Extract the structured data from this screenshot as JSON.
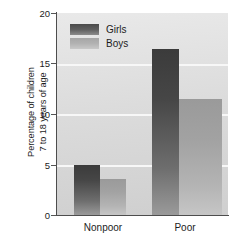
{
  "chart_data": {
    "type": "bar",
    "title": "",
    "xlabel": "",
    "ylabel_line1": "Percentage of children",
    "ylabel_line2": "7 to 18 years of age",
    "categories": [
      "Nonpoor",
      "Poor"
    ],
    "series": [
      {
        "name": "Girls",
        "values": [
          5.0,
          16.4
        ],
        "color": "#4a4a4a"
      },
      {
        "name": "Boys",
        "values": [
          3.6,
          11.5
        ],
        "color": "#a8a8a8"
      }
    ],
    "ylim": [
      0,
      20
    ],
    "yticks": [
      "0",
      "5",
      "10",
      "15",
      "20"
    ],
    "ytick_values": [
      0,
      5,
      10,
      15,
      20
    ],
    "grid": true,
    "legend_position": "top-left-inside",
    "plot_background": "#dedede",
    "gridline_color": "#f7f7f7",
    "axis_color": "#4d4d4d"
  },
  "legend": {
    "entries": [
      {
        "label": "Girls"
      },
      {
        "label": "Boys"
      }
    ]
  },
  "axis": {
    "x_categories": [
      "Nonpoor",
      "Poor"
    ],
    "y_ticks": [
      "20",
      "15",
      "10",
      "5",
      "0"
    ]
  }
}
